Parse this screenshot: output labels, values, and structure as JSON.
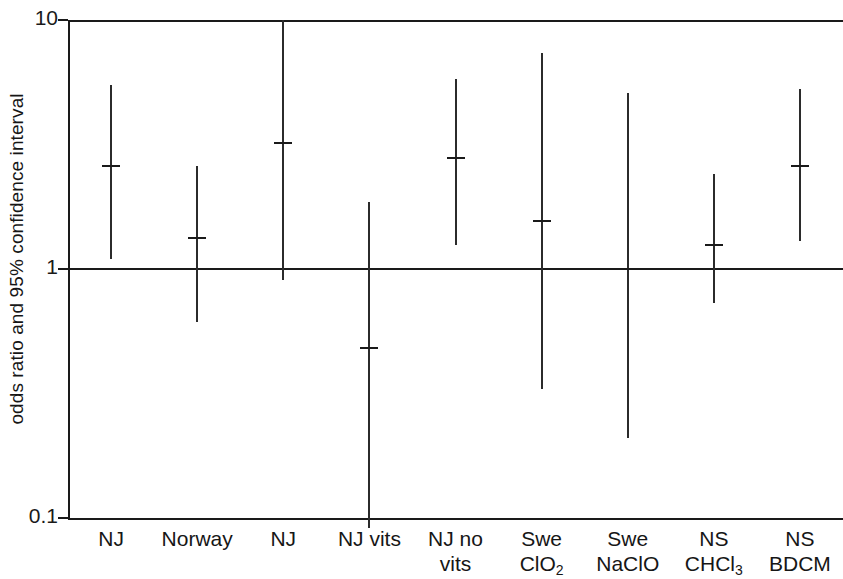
{
  "chart_data": {
    "type": "scatter",
    "title": "",
    "xlabel": "",
    "ylabel": "odds ratio and 95% confidence interval",
    "yscale": "log",
    "ylim": [
      0.1,
      10
    ],
    "ytick_labels": [
      "10",
      "1",
      "0.1"
    ],
    "ytick_values": [
      10,
      1,
      0.1
    ],
    "grid": false,
    "reference_line": 1,
    "legend": "none",
    "categories": [
      "NJ",
      "Norway",
      "NJ",
      "NJ vits",
      "NJ no vits",
      "Swe ClO2",
      "Swe NaClO",
      "NS CHCl3",
      "NS BDCM"
    ],
    "series": [
      {
        "name": "odds ratio",
        "values": [
          2.6,
          1.33,
          3.2,
          0.48,
          2.8,
          1.56,
          1.0,
          1.25,
          2.6
        ]
      },
      {
        "name": "ci_upper",
        "values": [
          5.5,
          2.6,
          10.0,
          1.85,
          5.8,
          7.4,
          5.1,
          2.4,
          5.3
        ]
      },
      {
        "name": "ci_lower",
        "values": [
          1.1,
          0.61,
          0.9,
          0.1,
          1.25,
          0.33,
          0.21,
          0.73,
          1.3
        ]
      }
    ],
    "points": [
      {
        "label": "NJ",
        "label_line1": "NJ",
        "label_line2": "",
        "or": 2.6,
        "low": 1.1,
        "high": 5.5,
        "high_clipped": false,
        "low_clipped": false
      },
      {
        "label": "Norway",
        "label_line1": "Norway",
        "label_line2": "",
        "or": 1.33,
        "low": 0.61,
        "high": 2.6,
        "high_clipped": false,
        "low_clipped": false
      },
      {
        "label": "NJ",
        "label_line1": "NJ",
        "label_line2": "",
        "or": 3.2,
        "low": 0.9,
        "high": 10.0,
        "high_clipped": true,
        "low_clipped": false
      },
      {
        "label": "NJ vits",
        "label_line1": "NJ vits",
        "label_line2": "",
        "or": 0.48,
        "low": 0.1,
        "high": 1.85,
        "high_clipped": false,
        "low_clipped": true
      },
      {
        "label": "NJ no vits",
        "label_line1": "NJ no",
        "label_line2": "vits",
        "or": 2.8,
        "low": 1.25,
        "high": 5.8,
        "high_clipped": false,
        "low_clipped": false
      },
      {
        "label": "Swe ClO2",
        "label_line1": "Swe",
        "label_line2": "ClO2",
        "or": 1.56,
        "low": 0.33,
        "high": 7.4,
        "high_clipped": false,
        "low_clipped": false
      },
      {
        "label": "Swe NaClO",
        "label_line1": "Swe",
        "label_line2": "NaClO",
        "or": 1.0,
        "low": 0.21,
        "high": 5.1,
        "high_clipped": false,
        "low_clipped": false
      },
      {
        "label": "NS CHCl3",
        "label_line1": "NS",
        "label_line2": "CHCl3",
        "or": 1.25,
        "low": 0.73,
        "high": 2.4,
        "high_clipped": false,
        "low_clipped": false
      },
      {
        "label": "NS BDCM",
        "label_line1": "NS",
        "label_line2": "BDCM",
        "or": 2.6,
        "low": 1.3,
        "high": 5.3,
        "high_clipped": false,
        "low_clipped": false
      }
    ]
  },
  "axis": {
    "y_title": "odds ratio and 95% confidence interval",
    "tick_top": "10",
    "tick_mid": "1",
    "tick_bottom": "0.1"
  },
  "colors": {
    "line": "#1a1a1a",
    "series": "#2b2b2b",
    "background": "#ffffff"
  }
}
